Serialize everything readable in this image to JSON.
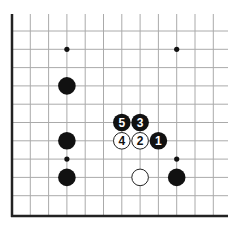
{
  "diagram": {
    "board": {
      "origin_x": 12,
      "origin_y": 31,
      "spacing": 18.3,
      "cols": 12,
      "rows": 11,
      "top_line_start": 14,
      "right_extent": 228,
      "left_edge": "thick",
      "bottom_edge": "thick",
      "line_color": "#aaaaaa",
      "edge_color": "#222222"
    },
    "star_points": [
      {
        "col": 3,
        "row": 1
      },
      {
        "col": 9,
        "row": 1
      },
      {
        "col": 3,
        "row": 7
      },
      {
        "col": 9,
        "row": 7
      }
    ],
    "stones": [
      {
        "color": "black",
        "col": 3,
        "row": 3,
        "label": ""
      },
      {
        "color": "black",
        "col": 3,
        "row": 6,
        "label": ""
      },
      {
        "color": "black",
        "col": 3,
        "row": 8,
        "label": ""
      },
      {
        "color": "black",
        "col": 6,
        "row": 5,
        "label": "5"
      },
      {
        "color": "black",
        "col": 7,
        "row": 5,
        "label": "3"
      },
      {
        "color": "white",
        "col": 6,
        "row": 6,
        "label": "4"
      },
      {
        "color": "white",
        "col": 7,
        "row": 6,
        "label": "2"
      },
      {
        "color": "black",
        "col": 8,
        "row": 6,
        "label": "1"
      },
      {
        "color": "white",
        "col": 7,
        "row": 8,
        "label": ""
      },
      {
        "color": "black",
        "col": 9,
        "row": 8,
        "label": ""
      }
    ],
    "colors": {
      "black_stone": "#111111",
      "white_stone": "#ffffff",
      "white_stroke": "#222222",
      "background": "#ffffff"
    }
  }
}
